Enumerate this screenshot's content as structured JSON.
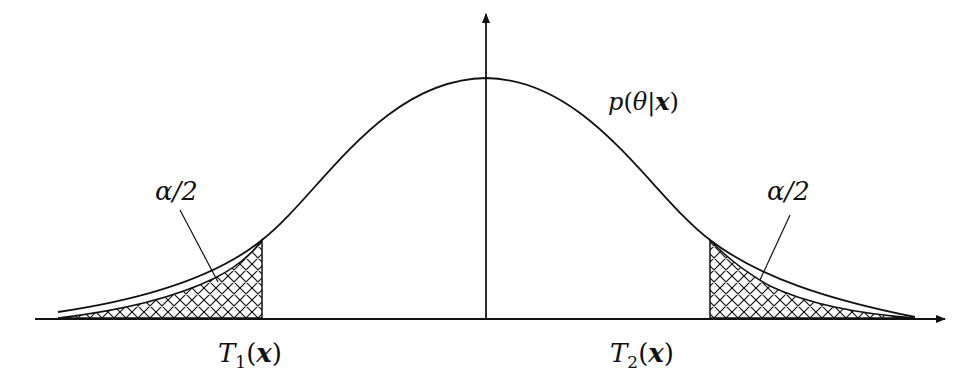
{
  "diagram": {
    "curve_label": {
      "func": "p",
      "arg": "θ",
      "sep": "|",
      "given": "x"
    },
    "tail_labels": [
      {
        "side": "left",
        "text": "α/2"
      },
      {
        "side": "right",
        "text": "α/2"
      }
    ],
    "bounds": [
      {
        "name": "T",
        "subscript": "1",
        "arg": "x"
      },
      {
        "name": "T",
        "subscript": "2",
        "arg": "x"
      }
    ]
  }
}
